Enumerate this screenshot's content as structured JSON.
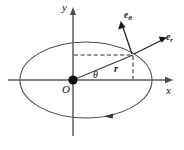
{
  "figure": {
    "name": "polar-coordinates-elliptical-orbit-diagram",
    "background_color": "#ffffff",
    "width": 184,
    "height": 150
  },
  "axes": {
    "x_label": "x",
    "y_label": "y",
    "origin_label": "O",
    "x_axis_color": "#5a5a5a",
    "y_axis_color": "#5a5a5a"
  },
  "orbit": {
    "shape": "ellipse",
    "center_x": 86,
    "center_y": 80,
    "semi_major": 66,
    "semi_minor": 38,
    "stroke_color": "#4d4d4d",
    "direction": "counterclockwise-arrow-on-lower-arc"
  },
  "point": {
    "x": 133,
    "y": 55
  },
  "labels": {
    "radius": "r",
    "angle": "θ",
    "unit_radial_base": "e",
    "unit_radial_sub": "r",
    "unit_transverse_base": "e",
    "unit_transverse_sub": "θ"
  },
  "colors": {
    "ink": "#111111",
    "dashed_guide": "#2f2f2f",
    "unit_vector": "#262626",
    "origin_dot": "#0b0b0b"
  }
}
